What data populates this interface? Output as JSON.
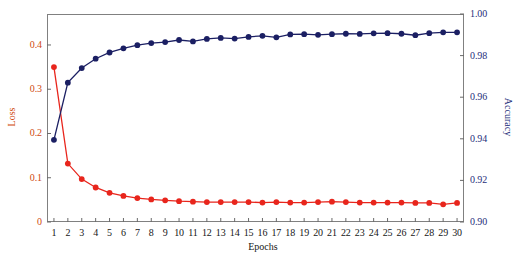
{
  "chart_data": {
    "type": "line",
    "title": "",
    "xlabel": "Epochs",
    "grid": false,
    "legend": "none",
    "x": [
      1,
      2,
      3,
      4,
      5,
      6,
      7,
      8,
      9,
      10,
      11,
      12,
      13,
      14,
      15,
      16,
      17,
      18,
      19,
      20,
      21,
      22,
      23,
      24,
      25,
      26,
      27,
      28,
      29,
      30
    ],
    "xtick_labels": [
      "1",
      "2",
      "3",
      "4",
      "5",
      "6",
      "7",
      "8",
      "9",
      "10",
      "11",
      "12",
      "13",
      "14",
      "15",
      "16",
      "17",
      "18",
      "19",
      "20",
      "21",
      "22",
      "23",
      "24",
      "25",
      "26",
      "27",
      "28",
      "29",
      "30"
    ],
    "xlim": [
      0.5,
      30.5
    ],
    "axes": [
      {
        "id": "left",
        "label": "Loss",
        "color": "#d04a10",
        "ylim": [
          0.0,
          0.47
        ],
        "ticks": [
          0,
          0.1,
          0.2,
          0.3,
          0.4
        ],
        "tick_labels": [
          "0",
          "0.1",
          "0.2",
          "0.3",
          "0.4"
        ]
      },
      {
        "id": "right",
        "label": "Accuracy",
        "color": "#262f7a",
        "ylim": [
          0.9,
          1.0
        ],
        "ticks": [
          0.9,
          0.92,
          0.94,
          0.96,
          0.98,
          1.0
        ],
        "tick_labels": [
          "0.90",
          "0.92",
          "0.94",
          "0.96",
          "0.98",
          "1.00"
        ]
      }
    ],
    "series": [
      {
        "name": "Loss",
        "axis": "left",
        "color": "#e8251c",
        "marker": "circle",
        "values": [
          0.35,
          0.132,
          0.097,
          0.078,
          0.066,
          0.059,
          0.054,
          0.051,
          0.049,
          0.047,
          0.046,
          0.045,
          0.045,
          0.045,
          0.045,
          0.044,
          0.045,
          0.044,
          0.044,
          0.045,
          0.046,
          0.045,
          0.044,
          0.044,
          0.044,
          0.044,
          0.043,
          0.043,
          0.04,
          0.043
        ]
      },
      {
        "name": "Accuracy",
        "axis": "right",
        "color": "#1b1f63",
        "marker": "circle",
        "values": [
          0.9395,
          0.967,
          0.974,
          0.9785,
          0.9815,
          0.9835,
          0.985,
          0.986,
          0.9865,
          0.9875,
          0.9868,
          0.988,
          0.9885,
          0.9882,
          0.989,
          0.9895,
          0.9888,
          0.9902,
          0.9903,
          0.99,
          0.9903,
          0.9905,
          0.9904,
          0.9907,
          0.9908,
          0.9905,
          0.9898,
          0.9908,
          0.9912,
          0.9912
        ]
      }
    ]
  }
}
